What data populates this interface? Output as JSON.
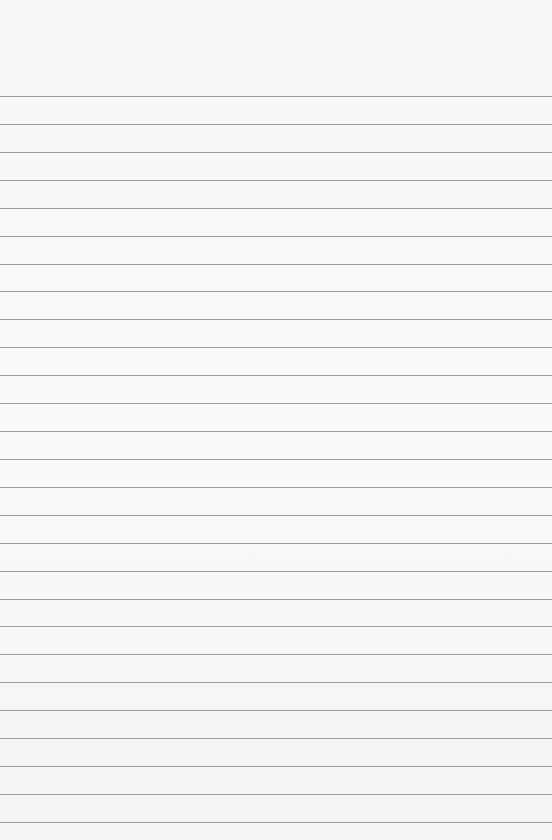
{
  "paper": {
    "line_color": "#9c9c9c",
    "background": "#f7f7f7",
    "first_line_y": 96,
    "line_spacing": 27.92,
    "line_count": 27
  }
}
